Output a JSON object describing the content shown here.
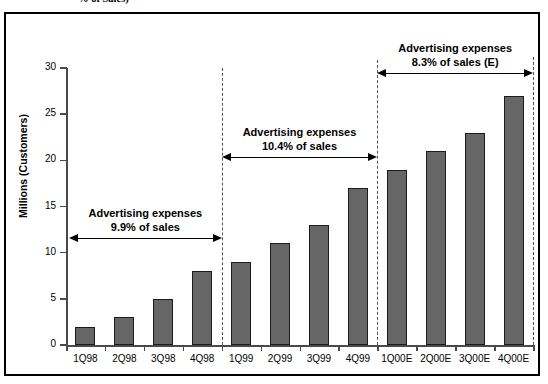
{
  "caption_fragment": "% of Sales)",
  "chart_data": {
    "type": "bar",
    "title": "",
    "xlabel": "",
    "ylabel": "Millions (Customers)",
    "ylim": [
      0,
      30
    ],
    "yticks": [
      0,
      5,
      10,
      15,
      20,
      25,
      30
    ],
    "ytick_labels": [
      "0",
      "5",
      "10",
      "15",
      "20",
      "25",
      "30"
    ],
    "grid": false,
    "legend": "none",
    "bar_color": "#666666",
    "bar_edge_color": "#1c1c1c",
    "categories": [
      "1Q98",
      "2Q98",
      "3Q98",
      "4Q98",
      "1Q99",
      "2Q99",
      "3Q99",
      "4Q99",
      "1Q00E",
      "2Q00E",
      "3Q00E",
      "4Q00E"
    ],
    "values": [
      2,
      3,
      5,
      8,
      9,
      11,
      13,
      17,
      19,
      21,
      23,
      27
    ],
    "annotations": [
      {
        "id": "period-1998",
        "line1": "Advertising expenses",
        "line2": "9.9% of sales",
        "percent": "9.9%",
        "span_start": "1Q98",
        "span_end": "4Q98"
      },
      {
        "id": "period-1999",
        "line1": "Advertising expenses",
        "line2": "10.4% of sales",
        "percent": "10.4%",
        "span_start": "1Q99",
        "span_end": "4Q99"
      },
      {
        "id": "period-2000E",
        "line1": "Advertising expenses",
        "line2": "8.3% of sales (E)",
        "percent": "8.3%",
        "span_start": "1Q00E",
        "span_end": "4Q00E"
      }
    ]
  }
}
